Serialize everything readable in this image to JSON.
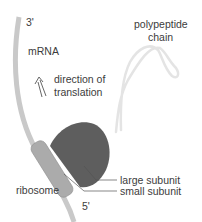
{
  "diagram": {
    "type": "translation",
    "labels": {
      "three_prime": "3'",
      "mrna": "mRNA",
      "direction_line1": "direction of",
      "direction_line2": "translation",
      "polypeptide_line1": "polypeptide",
      "polypeptide_line2": "chain",
      "large_subunit": "large subunit",
      "small_subunit": "small subunit",
      "ribosome": "ribosome",
      "five_prime": "5'"
    },
    "colors": {
      "mrna": "#c8c8c8",
      "large_subunit": "#5f5f5f",
      "small_subunit": "#a9a9a9",
      "polypeptide": "#e3e3e3",
      "leader_line": "#555555"
    }
  }
}
